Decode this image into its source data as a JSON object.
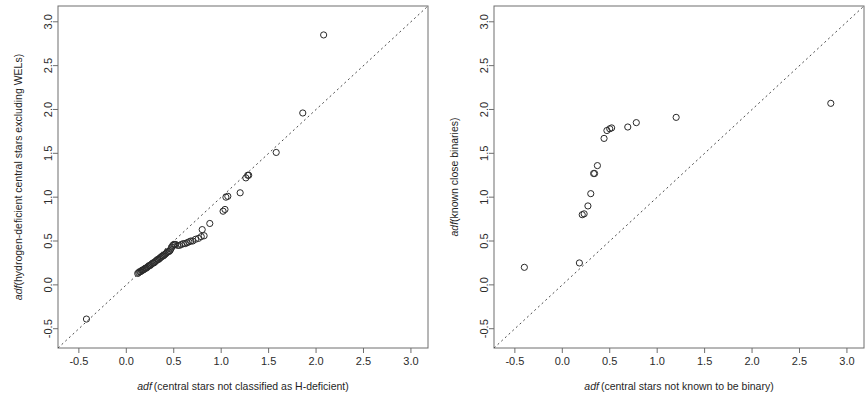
{
  "figure": {
    "background": "#ffffff",
    "point_color": "#2a2a2a",
    "reference_line_color": "#4a4a4a",
    "axis_color": "#6e6e6e",
    "panel_count": 2
  },
  "chart_data": [
    {
      "type": "scatter",
      "panel": "left",
      "title": "",
      "xlabel": "adf (central stars not classified as H-deficient)",
      "xlabel_italic": "adf",
      "xlabel_rest": "(central stars not classified as H-deficient)",
      "ylabel": "adf(hydrogen-deficient central stars excluding WELs)",
      "ylabel_italic": "adf",
      "ylabel_rest": "(hydrogen-deficient central stars excluding WELs)",
      "xlim": [
        -0.72,
        3.18
      ],
      "ylim": [
        -0.72,
        3.18
      ],
      "xticks": [
        -0.5,
        0.0,
        0.5,
        1.0,
        1.5,
        2.0,
        2.5,
        3.0
      ],
      "yticks": [
        -0.5,
        0.0,
        0.5,
        1.0,
        1.5,
        2.0,
        2.5,
        3.0
      ],
      "xtick_labels": [
        "-0.5",
        "0.0",
        "0.5",
        "1.0",
        "1.5",
        "2.0",
        "2.5",
        "3.0"
      ],
      "ytick_labels": [
        "-0.5",
        "0.0",
        "0.5",
        "1.0",
        "1.5",
        "2.0",
        "2.5",
        "3.0"
      ],
      "grid": false,
      "legend": null,
      "reference_line": {
        "type": "one-to-one dashed",
        "slope": 1,
        "intercept": 0,
        "style": "dashed"
      },
      "marker": "open circle",
      "points": [
        [
          -0.42,
          -0.39
        ],
        [
          0.12,
          0.13
        ],
        [
          0.13,
          0.14
        ],
        [
          0.14,
          0.15
        ],
        [
          0.15,
          0.15
        ],
        [
          0.16,
          0.16
        ],
        [
          0.17,
          0.17
        ],
        [
          0.18,
          0.17
        ],
        [
          0.19,
          0.18
        ],
        [
          0.2,
          0.19
        ],
        [
          0.21,
          0.19
        ],
        [
          0.22,
          0.2
        ],
        [
          0.23,
          0.21
        ],
        [
          0.24,
          0.22
        ],
        [
          0.25,
          0.22
        ],
        [
          0.26,
          0.23
        ],
        [
          0.27,
          0.24
        ],
        [
          0.28,
          0.25
        ],
        [
          0.29,
          0.25
        ],
        [
          0.3,
          0.26
        ],
        [
          0.31,
          0.27
        ],
        [
          0.32,
          0.28
        ],
        [
          0.33,
          0.29
        ],
        [
          0.34,
          0.29
        ],
        [
          0.35,
          0.3
        ],
        [
          0.36,
          0.31
        ],
        [
          0.37,
          0.32
        ],
        [
          0.38,
          0.33
        ],
        [
          0.39,
          0.33
        ],
        [
          0.4,
          0.34
        ],
        [
          0.41,
          0.35
        ],
        [
          0.42,
          0.36
        ],
        [
          0.43,
          0.37
        ],
        [
          0.44,
          0.38
        ],
        [
          0.45,
          0.38
        ],
        [
          0.46,
          0.39
        ],
        [
          0.47,
          0.41
        ],
        [
          0.48,
          0.43
        ],
        [
          0.49,
          0.45
        ],
        [
          0.5,
          0.46
        ],
        [
          0.51,
          0.46
        ],
        [
          0.52,
          0.46
        ],
        [
          0.54,
          0.45
        ],
        [
          0.56,
          0.45
        ],
        [
          0.58,
          0.46
        ],
        [
          0.6,
          0.47
        ],
        [
          0.62,
          0.47
        ],
        [
          0.64,
          0.48
        ],
        [
          0.66,
          0.49
        ],
        [
          0.68,
          0.5
        ],
        [
          0.7,
          0.5
        ],
        [
          0.73,
          0.52
        ],
        [
          0.76,
          0.53
        ],
        [
          0.79,
          0.55
        ],
        [
          0.8,
          0.63
        ],
        [
          0.82,
          0.56
        ],
        [
          0.88,
          0.7
        ],
        [
          1.02,
          0.84
        ],
        [
          1.04,
          0.86
        ],
        [
          1.05,
          1.0
        ],
        [
          1.07,
          1.01
        ],
        [
          1.2,
          1.05
        ],
        [
          1.26,
          1.22
        ],
        [
          1.28,
          1.25
        ],
        [
          1.29,
          1.25
        ],
        [
          1.58,
          1.51
        ],
        [
          1.86,
          1.96
        ],
        [
          2.08,
          2.85
        ]
      ]
    },
    {
      "type": "scatter",
      "panel": "right",
      "title": "",
      "xlabel": "adf (central stars not known to be binary)",
      "xlabel_italic": "adf",
      "xlabel_rest": "(central stars not known to be binary)",
      "ylabel": "adf(known close binaries)",
      "ylabel_italic": "adf",
      "ylabel_rest": "(known close binaries)",
      "xlim": [
        -0.72,
        3.18
      ],
      "ylim": [
        -0.72,
        3.18
      ],
      "xticks": [
        -0.5,
        0.0,
        0.5,
        1.0,
        1.5,
        2.0,
        2.5,
        3.0
      ],
      "yticks": [
        -0.5,
        0.0,
        0.5,
        1.0,
        1.5,
        2.0,
        2.5,
        3.0
      ],
      "xtick_labels": [
        "-0.5",
        "0.0",
        "0.5",
        "1.0",
        "1.5",
        "2.0",
        "2.5",
        "3.0"
      ],
      "ytick_labels": [
        "-0.5",
        "0.0",
        "0.5",
        "1.0",
        "1.5",
        "2.0",
        "2.5",
        "3.0"
      ],
      "grid": false,
      "legend": null,
      "reference_line": {
        "type": "one-to-one dashed",
        "slope": 1,
        "intercept": 0,
        "style": "dashed"
      },
      "marker": "open circle",
      "points": [
        [
          -0.4,
          0.2
        ],
        [
          0.18,
          0.25
        ],
        [
          0.21,
          0.8
        ],
        [
          0.23,
          0.81
        ],
        [
          0.27,
          0.9
        ],
        [
          0.3,
          1.04
        ],
        [
          0.33,
          1.27
        ],
        [
          0.34,
          1.27
        ],
        [
          0.37,
          1.36
        ],
        [
          0.44,
          1.67
        ],
        [
          0.47,
          1.76
        ],
        [
          0.5,
          1.78
        ],
        [
          0.52,
          1.79
        ],
        [
          0.69,
          1.8
        ],
        [
          0.78,
          1.85
        ],
        [
          1.2,
          1.91
        ],
        [
          2.83,
          2.07
        ]
      ]
    }
  ]
}
